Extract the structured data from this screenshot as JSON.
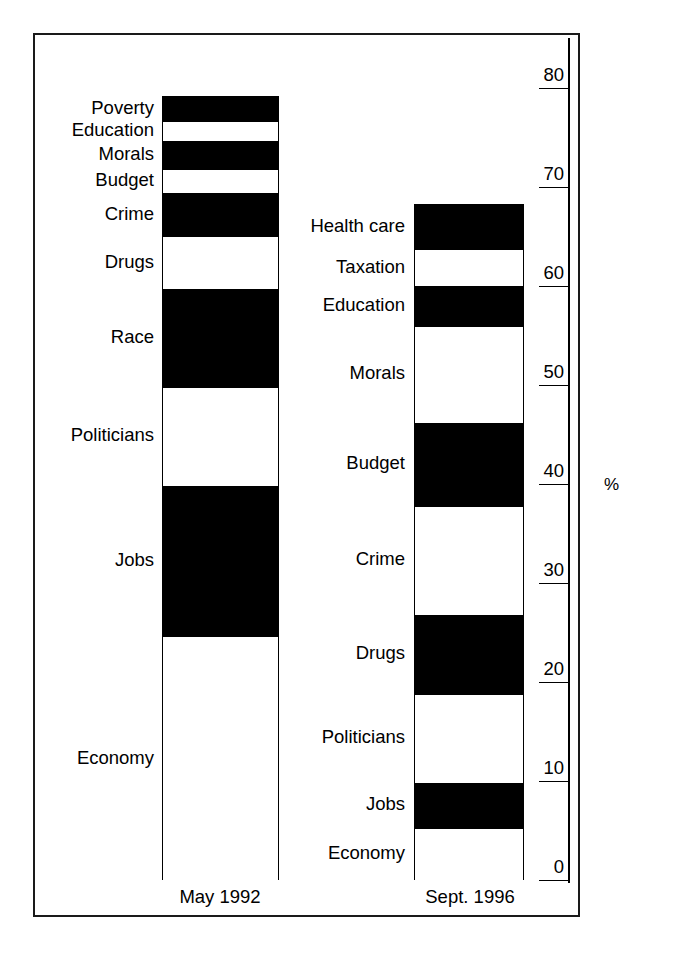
{
  "chart_data": {
    "type": "bar",
    "title": "",
    "subtitle": "",
    "xlabel": "",
    "ylabel": "%",
    "ylim": [
      0,
      80
    ],
    "yticks": [
      0,
      10,
      20,
      30,
      40,
      50,
      60,
      70,
      80
    ],
    "ytick_labels": [
      "0",
      "10",
      "20",
      "30",
      "40",
      "50",
      "60",
      "70",
      "80"
    ],
    "grid": false,
    "legend": "none",
    "stacked": true,
    "orientation": "vertical",
    "axis_position": "right",
    "categories": [
      "May 1992",
      "Sept. 1996"
    ],
    "series": [
      {
        "name": "May 1992",
        "total": 79.2,
        "segments": [
          {
            "label": "Economy",
            "value": 24.7,
            "fill": "unfilled",
            "cum_start": 0.0,
            "cum_end": 24.7
          },
          {
            "label": "Jobs",
            "value": 15.2,
            "fill": "filled",
            "cum_start": 24.7,
            "cum_end": 39.9
          },
          {
            "label": "Politicians",
            "value": 10.0,
            "fill": "unfilled",
            "cum_start": 39.9,
            "cum_end": 49.9
          },
          {
            "label": "Race",
            "value": 9.9,
            "fill": "filled",
            "cum_start": 49.9,
            "cum_end": 59.8
          },
          {
            "label": "Drugs",
            "value": 5.3,
            "fill": "unfilled",
            "cum_start": 59.8,
            "cum_end": 65.1
          },
          {
            "label": "Crime",
            "value": 4.4,
            "fill": "filled",
            "cum_start": 65.1,
            "cum_end": 69.5
          },
          {
            "label": "Budget",
            "value": 2.4,
            "fill": "unfilled",
            "cum_start": 69.5,
            "cum_end": 71.9
          },
          {
            "label": "Morals",
            "value": 2.8,
            "fill": "filled",
            "cum_start": 71.9,
            "cum_end": 74.7
          },
          {
            "label": "Education",
            "value": 2.1,
            "fill": "unfilled",
            "cum_start": 74.7,
            "cum_end": 76.8
          },
          {
            "label": "Poverty",
            "value": 2.3,
            "fill": "filled",
            "cum_start": 76.8,
            "cum_end": 79.2
          }
        ]
      },
      {
        "name": "Sept. 1996",
        "total": 68.3,
        "segments": [
          {
            "label": "Economy",
            "value": 5.4,
            "fill": "unfilled",
            "cum_start": 0.0,
            "cum_end": 5.4
          },
          {
            "label": "Jobs",
            "value": 4.5,
            "fill": "filled",
            "cum_start": 5.4,
            "cum_end": 9.9
          },
          {
            "label": "Politicians",
            "value": 9.0,
            "fill": "unfilled",
            "cum_start": 9.9,
            "cum_end": 18.9
          },
          {
            "label": "Drugs",
            "value": 8.0,
            "fill": "filled",
            "cum_start": 18.9,
            "cum_end": 26.9
          },
          {
            "label": "Crime",
            "value": 11.0,
            "fill": "unfilled",
            "cum_start": 26.9,
            "cum_end": 37.9
          },
          {
            "label": "Budget",
            "value": 8.4,
            "fill": "filled",
            "cum_start": 37.9,
            "cum_end": 46.3
          },
          {
            "label": "Morals",
            "value": 9.8,
            "fill": "unfilled",
            "cum_start": 46.3,
            "cum_end": 56.1
          },
          {
            "label": "Education",
            "value": 4.0,
            "fill": "filled",
            "cum_start": 56.1,
            "cum_end": 60.1
          },
          {
            "label": "Taxation",
            "value": 3.7,
            "fill": "unfilled",
            "cum_start": 60.1,
            "cum_end": 63.8
          },
          {
            "label": "Health care",
            "value": 4.5,
            "fill": "filled",
            "cum_start": 63.8,
            "cum_end": 68.3
          }
        ]
      }
    ]
  },
  "axis": {
    "unit": "%",
    "ticks": [
      {
        "label": "80",
        "value": 80
      },
      {
        "label": "70",
        "value": 70
      },
      {
        "label": "60",
        "value": 60
      },
      {
        "label": "50",
        "value": 50
      },
      {
        "label": "40",
        "value": 40
      },
      {
        "label": "30",
        "value": 30
      },
      {
        "label": "20",
        "value": 20
      },
      {
        "label": "10",
        "value": 10
      },
      {
        "label": "0",
        "value": 0
      }
    ]
  },
  "colors": {
    "filled": "#000000",
    "unfilled": "#ffffff",
    "outline": "#000000",
    "frame": "#1a1a1a",
    "background": "#ffffff",
    "text": "#000000"
  }
}
